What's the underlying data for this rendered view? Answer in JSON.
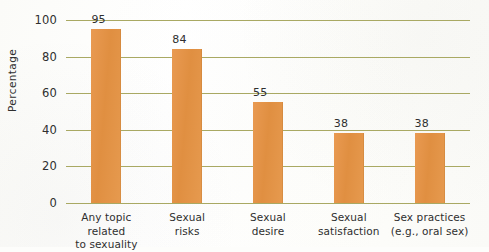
{
  "chart_data": {
    "type": "bar",
    "title": "",
    "xlabel": "",
    "ylabel": "Percentage",
    "ylim": [
      0,
      100
    ],
    "yticks": [
      0,
      20,
      40,
      60,
      80,
      100
    ],
    "ytick_labels": [
      "0",
      "20",
      "40",
      "60",
      "80",
      "100"
    ],
    "grid": true,
    "legend": false,
    "categories": [
      "Any topic related\nto sexuality",
      "Sexual\nrisks",
      "Sexual\ndesire",
      "Sexual\nsatisfaction",
      "Sex practices\n(e.g., oral sex)"
    ],
    "values": [
      95,
      84,
      55,
      38,
      38
    ],
    "value_labels": [
      "95",
      "84",
      "55",
      "38",
      "38"
    ],
    "colors": {
      "bar": "#E8954A",
      "gridline": "#A9A963",
      "text": "#2F2F2F",
      "background": "#FDFDFB"
    }
  }
}
